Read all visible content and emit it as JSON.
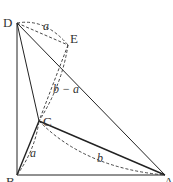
{
  "diagram": {
    "points": {
      "D": {
        "label": "D",
        "x": 17,
        "y": 23
      },
      "E": {
        "label": "E",
        "x": 68,
        "y": 45
      },
      "C": {
        "label": "C",
        "x": 39,
        "y": 121
      },
      "B": {
        "label": "B",
        "x": 17,
        "y": 175
      },
      "A": {
        "label": "A",
        "x": 165,
        "y": 175
      }
    },
    "segment_labels": {
      "DE": "a",
      "EC": "b − a",
      "BC": "a",
      "CA": "b"
    }
  }
}
